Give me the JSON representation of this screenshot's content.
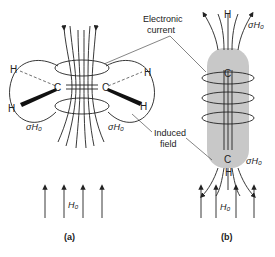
{
  "figure": {
    "callouts": {
      "electronic_current": [
        "Electronic",
        "current"
      ],
      "induced_field": [
        "Induced",
        "field"
      ]
    },
    "panel_a": {
      "label": "(a)",
      "atoms": {
        "carbon_left": "C",
        "carbon_right": "C",
        "h_top_left": "H",
        "h_bottom_left": "H",
        "h_top_right": "H",
        "h_bottom_right": "H"
      },
      "shielding_left": "σH₀",
      "shielding_right": "σH₀",
      "applied_field": "H₀",
      "applied_field_arrows": 4
    },
    "panel_b": {
      "label": "(b)",
      "atoms": {
        "carbon_top": "C",
        "carbon_bottom": "C",
        "h_top": "H",
        "h_bottom": "H"
      },
      "shielding_top": "σH₀",
      "shielding_bottom": "σH₀",
      "applied_field": "H₀",
      "applied_field_arrows": 4,
      "cylinder_color": "#c8c8c8"
    }
  }
}
